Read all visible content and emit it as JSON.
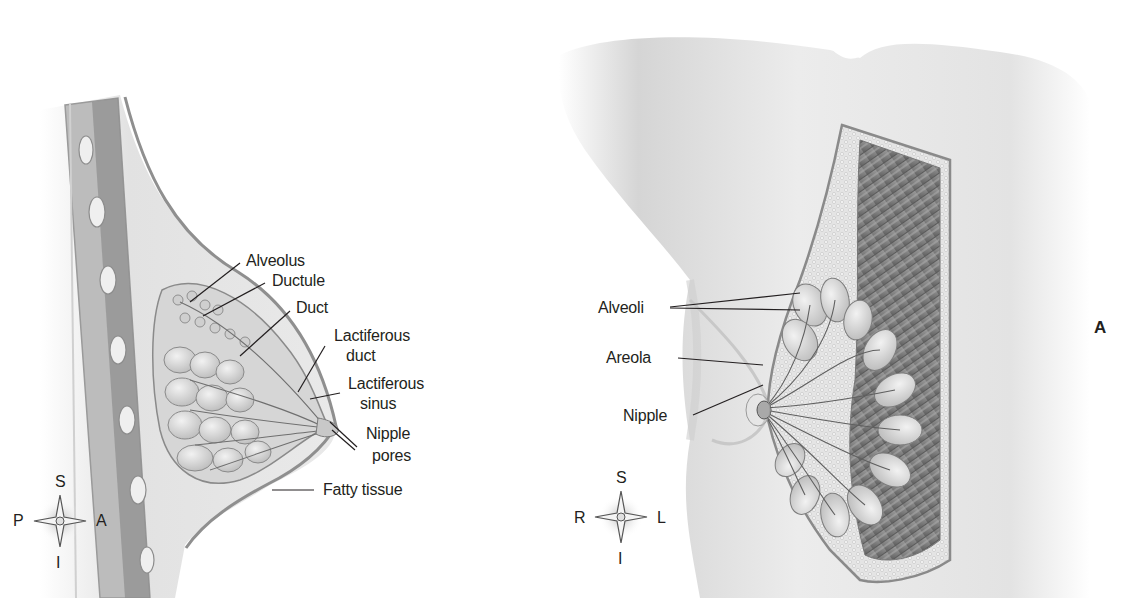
{
  "figure": {
    "panel_label": "A",
    "left_view": {
      "title": "Sagittal section of breast",
      "labels": {
        "alveolus": "Alveolus",
        "ductule": "Ductule",
        "duct": "Duct",
        "lactiferous_duct_1": "Lactiferous",
        "lactiferous_duct_2": "duct",
        "lactiferous_sinus_1": "Lactiferous",
        "lactiferous_sinus_2": "sinus",
        "nipple_pores_1": "Nipple",
        "nipple_pores_2": "pores",
        "fatty_tissue": "Fatty tissue"
      },
      "compass": {
        "top": "S",
        "bottom": "I",
        "left": "P",
        "right": "A"
      }
    },
    "right_view": {
      "title": "Anterior view of breast with cutaway",
      "labels": {
        "alveoli": "Alveoli",
        "areola": "Areola",
        "nipple": "Nipple"
      },
      "compass": {
        "top": "S",
        "bottom": "I",
        "left": "R",
        "right": "L"
      }
    },
    "colors": {
      "background": "#ffffff",
      "text": "#231f20",
      "leader_line": "#231f20",
      "skin": "#d9d9d9",
      "tissue_light": "#e6e6e6",
      "tissue_mid": "#bdbdbd",
      "muscle_dark": "#8a8a8a",
      "outline": "#9a9a9a"
    }
  }
}
